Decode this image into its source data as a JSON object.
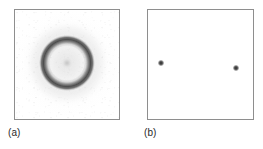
{
  "figure": {
    "background_color": "#ffffff",
    "frame_color": "#8e8e8e",
    "panels": [
      {
        "id": "a",
        "caption": "(a)",
        "pattern_type": "ring",
        "description": "diffuse dark ring (powder / Debye-Scherrer type ring) with soft halo and faint central spot",
        "frame": {
          "x": 14,
          "y": 9,
          "width": 106,
          "height": 111
        },
        "ring": {
          "center_x_pct": 50,
          "center_y_pct": 49,
          "outer_diameter_px": 56,
          "band_color": "#404040",
          "halo_color": "#cecece",
          "center_spot": true
        }
      },
      {
        "id": "b",
        "caption": "(b)",
        "pattern_type": "spots",
        "description": "two discrete sharp dark spots (single-crystal type reflections) on a blank plate",
        "frame": {
          "x": 147,
          "y": 9,
          "width": 107,
          "height": 111
        },
        "spots": [
          {
            "label": "left-spot",
            "x_pct": 12.0,
            "y_pct": 49.0,
            "diameter_px": 6,
            "color": "#262626"
          },
          {
            "label": "right-spot",
            "x_pct": 84.0,
            "y_pct": 53.0,
            "diameter_px": 6,
            "color": "#262626"
          }
        ]
      }
    ]
  }
}
